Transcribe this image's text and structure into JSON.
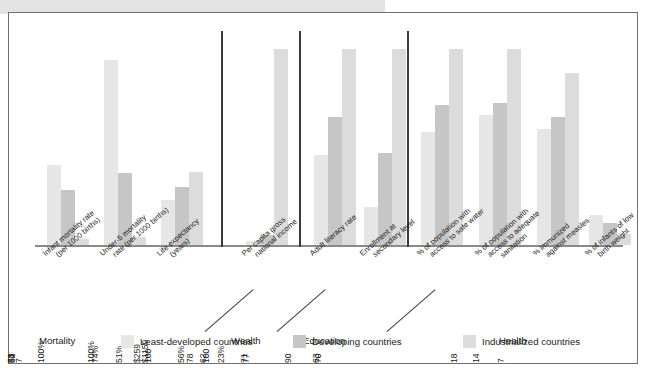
{
  "chart_data": {
    "type": "bar",
    "title": "",
    "xlabel": "",
    "ylabel": "",
    "grid": false,
    "legend_position": "bottom",
    "series": [
      {
        "name": "Least-developed countries",
        "color": "#e6e6e6",
        "values": [
          100,
          157,
          51,
          259,
          51,
          23,
          62,
          71,
          63,
          18
        ]
      },
      {
        "name": "Developing countries",
        "color": "#c6c6c6",
        "values": [
          62,
          89,
          62,
          1159,
          74,
          56,
          78,
          77,
          70,
          14
        ]
      },
      {
        "name": "Industrialized countries",
        "color": "#dcdcdc",
        "values": [
          5,
          7,
          78,
          28210,
          100,
          100,
          100,
          100,
          90,
          7
        ]
      }
    ],
    "categories": [
      "Infant mortality rate (per 1000 births)",
      "Under-5 mortality rate (per 1000 births)",
      "Life expectancy (years)",
      "Per capita gross national income",
      "Adult literacy rate",
      "Enrollment at secondary level",
      "% of population with access to safe water",
      "% of population with access to adequate sanitation",
      "% immunized against measles",
      "% of infants of low birth weight"
    ],
    "value_labels": [
      [
        "100",
        "62",
        "5"
      ],
      [
        "157",
        "89",
        "7"
      ],
      [
        "51",
        "62",
        "78"
      ],
      [
        "$259",
        "$1159",
        "$28,210"
      ],
      [
        "51%",
        "74%",
        "100%"
      ],
      [
        "23%",
        "56%",
        "100%"
      ],
      [
        "62",
        "78",
        "100"
      ],
      [
        "71",
        "77",
        "100"
      ],
      [
        "63",
        "70",
        "90"
      ],
      [
        "18",
        "14",
        "7"
      ]
    ]
  },
  "groups": [
    {
      "name": "Mortality",
      "indicators": [
        {
          "label_lines": [
            "Infant mortality rate",
            "(per 1000 births)"
          ]
        },
        {
          "label_lines": [
            "Under-5 mortality",
            "rate (per 1000 births)"
          ]
        },
        {
          "label_lines": [
            "Life expectancy",
            "(years)"
          ]
        }
      ]
    },
    {
      "name": "Wealth",
      "indicators": [
        {
          "label_lines": [
            "Per capita gross",
            "national income"
          ]
        }
      ]
    },
    {
      "name": "Education",
      "indicators": [
        {
          "label_lines": [
            "Adult literacy rate"
          ]
        },
        {
          "label_lines": [
            "Enrollment at",
            "secondary level"
          ]
        }
      ]
    },
    {
      "name": "Health",
      "indicators": [
        {
          "label_lines": [
            "% of population with",
            "access to safe water"
          ]
        },
        {
          "label_lines": [
            "% of population with",
            "access to adequate",
            "sanitation"
          ]
        },
        {
          "label_lines": [
            "% immunized",
            "against measles"
          ]
        },
        {
          "label_lines": [
            "% of infants of low",
            "birth weight"
          ]
        }
      ]
    }
  ],
  "legend": {
    "items": [
      {
        "label": "Least-developed countries",
        "color": "#e6e6e6"
      },
      {
        "label": "Developing countries",
        "color": "#c6c6c6"
      },
      {
        "label": "Industrialized countries",
        "color": "#dcdcdc"
      }
    ]
  }
}
